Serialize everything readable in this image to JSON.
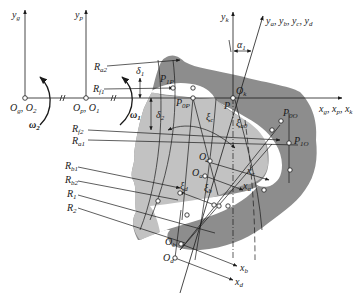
{
  "diagram": {
    "axes": {
      "yg": "y",
      "yg_sub": "g",
      "yp": "y",
      "yp_sub": "p",
      "yk": "y",
      "yk_sub": "k",
      "y_group": "y",
      "y_group_sub": "a",
      "y_group_rest": ", y",
      "y_group_rest_sub": "b",
      "y_group_rest2": ", y",
      "y_group_rest2_sub": "c",
      "y_group_rest3": ", y",
      "y_group_rest3_sub": "d",
      "x_group": "x",
      "x_group_sub1": "g",
      "x_group_sep1": ", x",
      "x_group_sub2": "p",
      "x_group_sep2": ", x",
      "x_group_sub3": "k",
      "xc": "x",
      "xc_sub": "c",
      "xa": "x",
      "xa_sub": "a",
      "xb": "x",
      "xb_sub": "b",
      "xd": "x",
      "xd_sub": "d"
    },
    "origins": {
      "Og_O2": "O",
      "Og_sub": "g",
      "Og_sep": ", O",
      "O2_sub": "2",
      "Op_O1": "O",
      "Op_sub": "p",
      "Op_sep": ", O",
      "O1_sub": "1",
      "Ok": "O",
      "Ok_sub": "k",
      "Oc": "O",
      "Oc_sub": "c",
      "Oa": "O",
      "Oa_sub": "a",
      "Ob": "O",
      "Ob_sub": "b",
      "Od": "O",
      "Od_sub": "d"
    },
    "radii": {
      "Ra2": "R",
      "Ra2_sub": "a2",
      "Rf1": "R",
      "Rf1_sub": "f1",
      "Rf2": "R",
      "Rf2_sub": "f2",
      "Ra1": "R",
      "Ra1_sub": "a1",
      "Rb1": "R",
      "Rb1_sub": "b1",
      "Rb2": "R",
      "Rb2_sub": "b2",
      "R1": "R",
      "R1_sub": "1",
      "R2": "R",
      "R2_sub": "2"
    },
    "points": {
      "P": "P",
      "P1P": "P",
      "P1P_sub": "1P",
      "P0P": "P",
      "P0P_sub": "0P",
      "P0O": "P",
      "P0O_sub": "0O",
      "P1O": "P",
      "P1O_sub": "1O"
    },
    "angles": {
      "omega2": "ω",
      "omega2_sub": "2",
      "omega1": "ω",
      "omega1_sub": "1",
      "delta1": "δ",
      "delta1_sub": "1",
      "delta2": "δ",
      "delta2_sub": "2",
      "alpha1": "α",
      "alpha1_sub": "1",
      "xi_c": "ξ",
      "xi_c_sub": "c",
      "xi_a0": "ξ",
      "xi_a0_sub": "a0",
      "xi_d": "ξ",
      "xi_d_sub": "d",
      "xi_b": "ξ",
      "xi_b_sub": "b"
    },
    "colors": {
      "dark_region": "#8a8a8a",
      "light_region": "#bdbdbd",
      "line": "#1a1a1a",
      "background": "#ffffff"
    }
  }
}
